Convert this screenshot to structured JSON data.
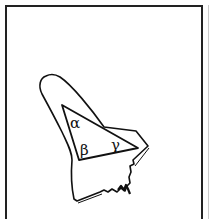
{
  "figure": {
    "angle_labels": {
      "alpha": "α",
      "beta": "β",
      "gamma": "γ"
    },
    "colors": {
      "stroke": "#111111",
      "background": "#ffffff",
      "frame": "#222222"
    }
  }
}
